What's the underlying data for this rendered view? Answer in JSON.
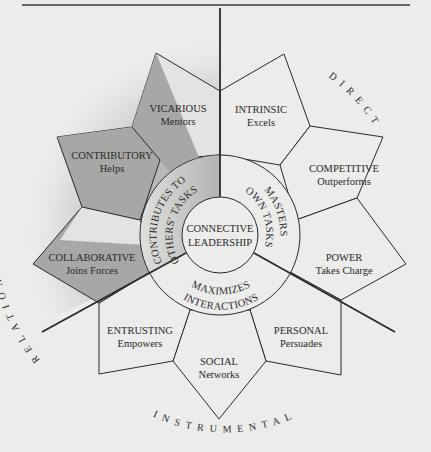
{
  "diagram": {
    "center": {
      "line1": "CONNECTIVE",
      "line2": "LEADERSHIP"
    },
    "ring": {
      "left": {
        "line1": "CONTRIBUTES TO",
        "line2": "OTHERS' TASKS"
      },
      "right": {
        "line1": "MASTERS",
        "line2": "OWN TASKS"
      },
      "bottom": {
        "line1": "MAXIMIZES",
        "line2": "INTERACTIONS"
      }
    },
    "dimensions": {
      "relational": "RELATIONAL",
      "direct": "DIRECT",
      "instrumental": "INSTRUMENTAL"
    },
    "petals": [
      {
        "id": "vicarious",
        "label": "VICARIOUS",
        "sub": "Mentors",
        "group": "relational"
      },
      {
        "id": "intrinsic",
        "label": "INTRINSIC",
        "sub": "Excels",
        "group": "direct"
      },
      {
        "id": "competitive",
        "label": "COMPETITIVE",
        "sub": "Outperforms",
        "group": "direct"
      },
      {
        "id": "power",
        "label": "POWER",
        "sub": "Takes Charge",
        "group": "direct"
      },
      {
        "id": "personal",
        "label": "PERSONAL",
        "sub": "Persuades",
        "group": "instrumental"
      },
      {
        "id": "social",
        "label": "SOCIAL",
        "sub": "Networks",
        "group": "instrumental"
      },
      {
        "id": "entrusting",
        "label": "ENTRUSTING",
        "sub": "Empowers",
        "group": "instrumental"
      },
      {
        "id": "collaborative",
        "label": "COLLABORATIVE",
        "sub": "Joins Forces",
        "group": "relational"
      },
      {
        "id": "contributory",
        "label": "CONTRIBUTORY",
        "sub": "Helps",
        "group": "relational"
      }
    ],
    "colors": {
      "background": "#ececea",
      "line": "#2a2a2a",
      "shade": "#a9a9a7",
      "shade_light": "#cfcfcd"
    }
  }
}
